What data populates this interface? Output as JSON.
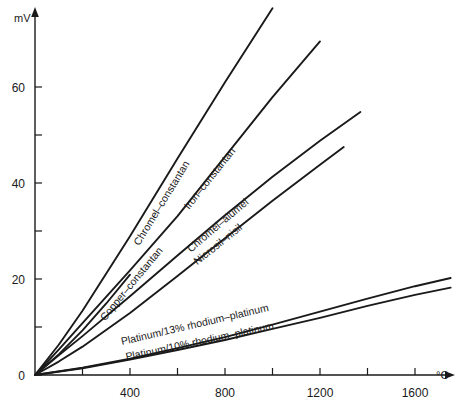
{
  "chart_data": {
    "type": "line",
    "title": "",
    "xlabel": "°C",
    "ylabel": "mV",
    "xlim": [
      0,
      1770
    ],
    "ylim": [
      0,
      77
    ],
    "grid": false,
    "legend": "inline-curve-labels",
    "x_ticks_major": [
      400,
      800,
      1200,
      1600
    ],
    "x_ticks_minor": [
      200,
      600,
      1000,
      1400
    ],
    "x_tick_labels": [
      "400",
      "800",
      "1200",
      "1600"
    ],
    "y_ticks_major": [
      0,
      20,
      40,
      60
    ],
    "y_ticks_minor": [
      10,
      30,
      50
    ],
    "y_tick_labels": [
      "0",
      "20",
      "40",
      "60"
    ],
    "series": [
      {
        "name": "Chromel–constantan",
        "label": "Chromel–constantan",
        "label_x": 560,
        "label_y": 35,
        "x": [
          0,
          100,
          200,
          400,
          600,
          800,
          1000
        ],
        "y": [
          0,
          6.3,
          13.4,
          28.9,
          45.1,
          61.0,
          76.4
        ]
      },
      {
        "name": "Iron–constantan",
        "label": "Iron–constantan",
        "label_x": 760,
        "label_y": 40,
        "x": [
          0,
          100,
          200,
          400,
          600,
          800,
          1000,
          1200
        ],
        "y": [
          0,
          5.3,
          10.8,
          21.8,
          33.1,
          45.5,
          57.9,
          69.5
        ]
      },
      {
        "name": "Chromel–alumel",
        "label": "Chromel–alumel",
        "label_x": 790,
        "label_y": 30,
        "x": [
          0,
          100,
          200,
          400,
          600,
          800,
          1000,
          1200,
          1370
        ],
        "y": [
          0,
          4.1,
          8.1,
          16.4,
          24.9,
          33.3,
          41.3,
          48.8,
          54.8
        ]
      },
      {
        "name": "Copper–constantan",
        "label": "Copper–constantan",
        "label_x": 430,
        "label_y": 18,
        "x": [
          0,
          100,
          200,
          300,
          400
        ],
        "y": [
          0,
          4.3,
          9.3,
          14.9,
          20.9
        ]
      },
      {
        "name": "Nicrosil–nisil",
        "label": "Nicrosil–nisil",
        "label_x": 790,
        "label_y": 26,
        "x": [
          0,
          100,
          200,
          400,
          600,
          800,
          1000,
          1200,
          1300
        ],
        "y": [
          0,
          2.8,
          5.9,
          12.9,
          20.6,
          28.5,
          36.3,
          43.8,
          47.5
        ]
      },
      {
        "name": "Platinum/13% rhodium–platinum",
        "label": "Platinum/13% rhodium–platinum",
        "label_x": 680,
        "label_y": 9,
        "x": [
          0,
          200,
          400,
          600,
          800,
          1000,
          1200,
          1400,
          1600,
          1750
        ],
        "y": [
          0,
          1.5,
          3.4,
          5.6,
          7.9,
          10.5,
          13.2,
          15.9,
          18.5,
          20.2
        ]
      },
      {
        "name": "Platinum/10% rhodium–platinum",
        "label": "Platinum/10% rhodium–platinum",
        "label_x": 700,
        "label_y": 5.5,
        "x": [
          0,
          200,
          400,
          600,
          800,
          1000,
          1200,
          1400,
          1600,
          1750
        ],
        "y": [
          0,
          1.4,
          3.2,
          5.2,
          7.3,
          9.6,
          11.9,
          14.4,
          16.7,
          18.2
        ]
      }
    ]
  },
  "axes": {
    "y_axis_title": "mV",
    "x_axis_title": "°C"
  },
  "colors": {
    "ink": "#1a1a1a",
    "background": "#ffffff"
  }
}
